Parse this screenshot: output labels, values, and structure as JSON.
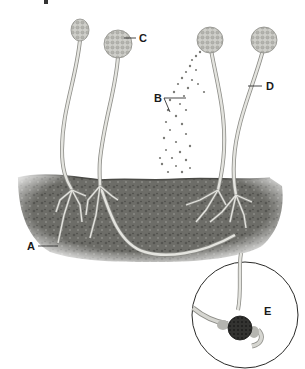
{
  "diagram": {
    "labels": {
      "A": "A",
      "B": "B",
      "C": "C",
      "D": "D",
      "E": "E"
    },
    "parts": [
      {
        "label": "A",
        "points_to": "rhizoid / stolon hypha below substrate"
      },
      {
        "label": "B",
        "points_to": "released spores"
      },
      {
        "label": "C",
        "points_to": "sporangium"
      },
      {
        "label": "D",
        "points_to": "sporangiophore stalk"
      },
      {
        "label": "E",
        "points_to": "zygosporangium (inset)"
      }
    ],
    "colors": {
      "background": "#ffffff",
      "substrate": "#6f6f6a",
      "substrate_dark": "#4e4e4a",
      "hypha": "#e4e4df",
      "hypha_outline": "#8d8d88",
      "sporangium": "#c9c9c4",
      "spore": "#7a7a76",
      "zygospore": "#2e2e2c",
      "label": "#1a1a1a"
    }
  }
}
